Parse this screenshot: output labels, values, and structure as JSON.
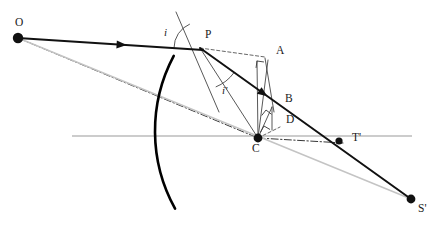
{
  "figure": {
    "type": "geometric-optics-diagram",
    "width": 440,
    "height": 242,
    "background": "#ffffff"
  },
  "colors": {
    "ray_solid": "#111111",
    "mirror": "#000000",
    "axis_gray": "#9a9a9a",
    "chord_gray": "#c4c4c4",
    "dashdot": "#2b2b2b",
    "dashed": "#555555",
    "thin_construction": "#3a3a3a",
    "label_text": "#1a1a1a"
  },
  "points": [
    {
      "id": "O",
      "label": "O",
      "x": 18,
      "y": 38,
      "label_x": 15,
      "label_y": 17,
      "dot": true,
      "dot_r": 5.2
    },
    {
      "id": "P",
      "label": "P",
      "x": 200,
      "y": 48,
      "label_x": 205,
      "label_y": 29,
      "dot": false,
      "dot_r": 0
    },
    {
      "id": "A",
      "label": "A",
      "x": 257,
      "y": 61,
      "label_x": 276,
      "label_y": 45,
      "dot": false,
      "dot_r": 0
    },
    {
      "id": "B",
      "label": "B",
      "x": 272,
      "y": 107,
      "label_x": 285,
      "label_y": 93,
      "dot": false,
      "dot_r": 0
    },
    {
      "id": "D",
      "label": "D",
      "x": 272,
      "y": 127,
      "label_x": 286,
      "label_y": 114,
      "dot": false,
      "dot_r": 0
    },
    {
      "id": "C",
      "label": "C",
      "x": 258,
      "y": 138,
      "label_x": 252,
      "label_y": 143,
      "dot": true,
      "dot_r": 4.4
    },
    {
      "id": "T",
      "label": "T'",
      "x": 339,
      "y": 141,
      "label_x": 352,
      "label_y": 132,
      "dot": true,
      "dot_r": 3.6
    },
    {
      "id": "S",
      "label": "S'",
      "x": 411,
      "y": 199,
      "label_x": 418,
      "label_y": 203,
      "dot": true,
      "dot_r": 4.4
    }
  ],
  "angle_labels": [
    {
      "id": "i",
      "label": "i",
      "x": 164,
      "y": 27
    },
    {
      "id": "iprime",
      "label": "i'",
      "x": 222,
      "y": 85
    }
  ],
  "mirror": {
    "name": "concave-spherical-mirror-arc",
    "center_x": 315,
    "center_y": 131,
    "radius": 160,
    "start_angle_deg": 208,
    "end_angle_deg": 151,
    "stroke_width": 2.6
  },
  "axis": {
    "name": "principal-axis",
    "x1": 72,
    "y1": 136,
    "x2": 412,
    "y2": 136,
    "stroke_width": 1.2
  },
  "rays": {
    "incident": {
      "name": "incident-ray-O-to-P",
      "x1": 18,
      "y1": 38,
      "x2": 203,
      "y2": 50,
      "arrow_t": 0.56,
      "stroke_width": 2.0
    },
    "reflected": {
      "name": "reflected-ray-P-to-S",
      "x1": 200,
      "y1": 48,
      "x2": 411,
      "y2": 199,
      "arrow_t": 0.3,
      "stroke_width": 2.0
    }
  },
  "construction_lines": [
    {
      "name": "dashdot-O-to-C",
      "style": "dashdot",
      "x1": 18,
      "y1": 38,
      "x2": 258,
      "y2": 138
    },
    {
      "name": "dashdot-C-to-T",
      "style": "dashdot",
      "x1": 258,
      "y1": 138,
      "x2": 343,
      "y2": 143
    },
    {
      "name": "chord-O-to-S",
      "style": "gray",
      "x1": 18,
      "y1": 38,
      "x2": 411,
      "y2": 199
    },
    {
      "name": "dashed-P-to-A",
      "style": "dashed",
      "x1": 200,
      "y1": 48,
      "x2": 265,
      "y2": 57
    },
    {
      "name": "dashed-C-to-D",
      "style": "dashed",
      "x1": 258,
      "y1": 138,
      "x2": 280,
      "y2": 127
    },
    {
      "name": "normal-line-at-P",
      "style": "thin",
      "x1": 176,
      "y1": 12,
      "x2": 219,
      "y2": 112
    },
    {
      "name": "thin-P-to-C",
      "style": "thin",
      "x1": 200,
      "y1": 48,
      "x2": 258,
      "y2": 138
    },
    {
      "name": "thin-C-to-A",
      "style": "thin",
      "x1": 258,
      "y1": 138,
      "x2": 257,
      "y2": 61
    },
    {
      "name": "thin-C-to-A-right",
      "style": "thin",
      "x1": 258,
      "y1": 138,
      "x2": 268,
      "y2": 60
    },
    {
      "name": "thin-A-to-B",
      "style": "thin",
      "x1": 265,
      "y1": 58,
      "x2": 274,
      "y2": 112
    },
    {
      "name": "thin-C-to-B",
      "style": "thin",
      "x1": 258,
      "y1": 138,
      "x2": 272,
      "y2": 107
    },
    {
      "name": "thin-B-to-D",
      "style": "thin",
      "x1": 272,
      "y1": 107,
      "x2": 272,
      "y2": 130
    }
  ],
  "right_angle_marks": [
    {
      "name": "right-angle-at-A",
      "x": 257,
      "y": 61,
      "rot_deg": 8
    },
    {
      "name": "right-angle-at-B",
      "x": 266,
      "y": 110,
      "rot_deg": 38
    },
    {
      "name": "right-angle-at-D",
      "x": 264,
      "y": 126,
      "rot_deg": 30
    }
  ],
  "angle_arcs": [
    {
      "name": "angle-arc-i",
      "cx": 200,
      "cy": 48,
      "r": 26,
      "a1": 180,
      "a2": 247
    },
    {
      "name": "angle-arc-i-prime",
      "cx": 200,
      "cy": 48,
      "r": 42,
      "a1": 36,
      "a2": 68
    }
  ]
}
